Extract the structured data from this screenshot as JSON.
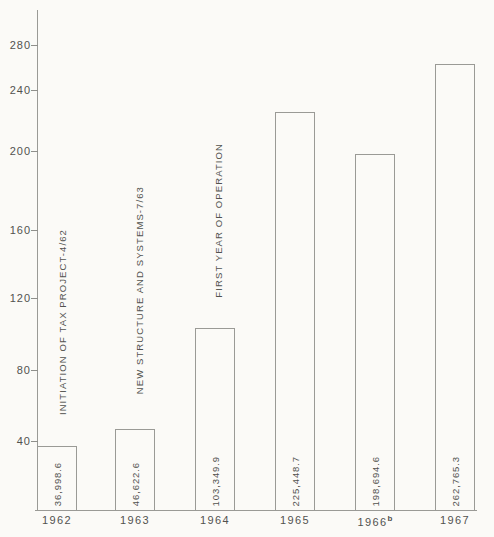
{
  "chart_data": {
    "type": "bar",
    "categories": [
      "1962",
      "1963",
      "1964",
      "1965",
      "1966",
      "1967"
    ],
    "category_superscripts": [
      "",
      "",
      "",
      "",
      "b",
      ""
    ],
    "values": [
      36998.6,
      46622.6,
      103349.9,
      225448.7,
      198694.6,
      262765.3
    ],
    "bar_value_labels": [
      "36,998.6",
      "46,622.6",
      "103,349.9",
      "225,448.7",
      "198,694.6",
      "262,765.3"
    ],
    "yticks": [
      40,
      80,
      120,
      160,
      200,
      240,
      280
    ],
    "ylim": [
      0,
      300
    ],
    "axis_divisor": 1000,
    "grid": false,
    "legend": false,
    "annotations": [
      {
        "text": "INITIATION OF TAX PROJECT-4/62",
        "over_bar": "1962"
      },
      {
        "text": "NEW STRUCTURE AND SYSTEMS-7/63",
        "over_bar": "1963"
      },
      {
        "text": "FIRST YEAR OF OPERATION",
        "over_bar": "1964"
      }
    ],
    "colors": {
      "paper": "#fbfaf7",
      "line": "#9a9a96",
      "ink": "#52524f"
    }
  }
}
